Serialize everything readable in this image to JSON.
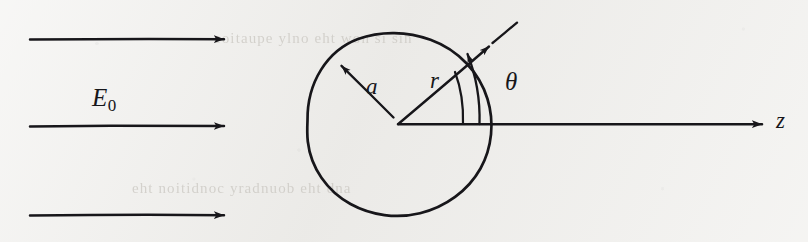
{
  "figure": {
    "width": 808,
    "height": 242,
    "background_color": "#eeedea",
    "ink_color": "#17161a",
    "ghost_text_color": "#c9c6c0"
  },
  "labels": {
    "field_symbol": "E",
    "field_subscript": "0",
    "sphere_radius": "a",
    "radial_coordinate": "r",
    "polar_angle": "θ",
    "axis": "z"
  },
  "field_arrows": [
    {
      "name": "field-arrow-top",
      "x1": 30,
      "y1": 39,
      "x2": 232,
      "y2": 39
    },
    {
      "name": "field-arrow-middle",
      "x1": 30,
      "y1": 126,
      "x2": 232,
      "y2": 126
    },
    {
      "name": "field-arrow-bottom",
      "x1": 30,
      "y1": 215,
      "x2": 232,
      "y2": 215
    }
  ],
  "sphere": {
    "center_x": 399,
    "center_y": 126,
    "radius": 93
  },
  "origin": {
    "x": 398,
    "y": 124
  },
  "radius_arrow_a": {
    "x1": 392,
    "y1": 116,
    "x2": 334,
    "y2": 59
  },
  "radius_arrow_r": {
    "x1": 398,
    "y1": 124,
    "x2": 495,
    "y2": 40
  },
  "theta_arc": {
    "start_x": 479,
    "start_y": 124,
    "end_x": 465,
    "end_y": 48,
    "sweep_radius": 81
  },
  "z_axis": {
    "x1": 398,
    "y1": 124,
    "x2": 772,
    "y2": 124
  },
  "ghost_text": {
    "top": "eoitaupe  ylno  eht  won  si  sih",
    "bottom": "eht  noitidnoc  yradnuob  eht  dna"
  }
}
